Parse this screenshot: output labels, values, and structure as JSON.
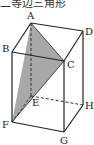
{
  "caption": "二等边三角形",
  "figure": {
    "type": "rectangular-prism",
    "shaded_face": [
      "A",
      "C",
      "F"
    ],
    "shade_color": "#a8a8a8",
    "line_color": "#222222",
    "vertices": {
      "A": {
        "label": "A",
        "x": 31,
        "y": 23
      },
      "D": {
        "label": "D",
        "x": 83,
        "y": 31
      },
      "B": {
        "label": "B",
        "x": 12,
        "y": 52
      },
      "C": {
        "label": "C",
        "x": 64,
        "y": 61
      },
      "E": {
        "label": "E",
        "x": 31,
        "y": 96
      },
      "H": {
        "label": "H",
        "x": 83,
        "y": 105
      },
      "F": {
        "label": "F",
        "x": 12,
        "y": 122
      },
      "G": {
        "label": "G",
        "x": 64,
        "y": 132
      }
    },
    "hidden_edges": [
      [
        "A",
        "E"
      ],
      [
        "E",
        "F"
      ],
      [
        "E",
        "H"
      ]
    ]
  }
}
